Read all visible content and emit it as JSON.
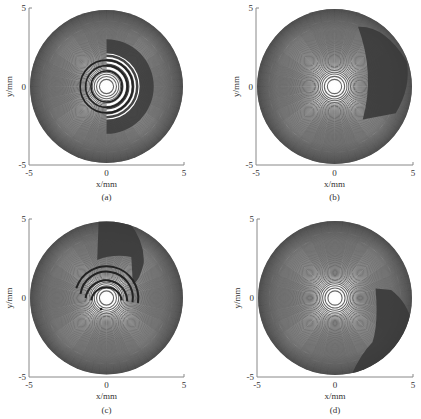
{
  "figure": {
    "panels": [
      {
        "id": "a",
        "caption": "(a)",
        "xlabel": "x/mm",
        "ylabel": "y/mm",
        "xticks": [
          "-5",
          "0",
          "5"
        ],
        "yticks": [
          "5",
          "0",
          "-5"
        ],
        "xlim": [
          -5,
          5
        ],
        "ylim": [
          -5,
          5
        ],
        "region": {
          "description": "dark half-annulus on right side (x>0), radius ~1 to ~3 mm",
          "x_from": 0,
          "r_inner": 1.0,
          "r_outer": 3.0
        }
      },
      {
        "id": "b",
        "caption": "(b)",
        "xlabel": "x/mm",
        "ylabel": "y/mm",
        "xticks": [
          "-5",
          "0",
          "5"
        ],
        "yticks": [
          "5",
          "0",
          "-5"
        ],
        "xlim": [
          -5,
          5
        ],
        "ylim": [
          -5,
          5
        ],
        "region": {
          "description": "dark crescent near right edge, x ~1.5 to 4.8 mm, y ~-2 to 3.8 mm"
        }
      },
      {
        "id": "c",
        "caption": "(c)",
        "xlabel": "x/mm",
        "ylabel": "y/mm",
        "xticks": [
          "-5",
          "0",
          "5"
        ],
        "yticks": [
          "5",
          "0",
          "-5"
        ],
        "xlim": [
          -5,
          5
        ],
        "ylim": [
          -5,
          5
        ],
        "region": {
          "description": "dark region at top, x ~-0.5 to 2.5 mm, y ~1 to 5 mm, with partial dark rings below"
        }
      },
      {
        "id": "d",
        "caption": "(d)",
        "xlabel": "x/mm",
        "ylabel": "y/mm",
        "xticks": [
          "-5",
          "0",
          "5"
        ],
        "yticks": [
          "5",
          "0",
          "-5"
        ],
        "xlim": [
          -5,
          5
        ],
        "ylim": [
          -5,
          5
        ],
        "region": {
          "description": "dark region lower-right, x ~1 to 5 mm, y ~-5 to 0.5 mm"
        }
      }
    ],
    "colors": {
      "ring": "#555555",
      "dark_region": "#3a3a3a",
      "axis": "#888888",
      "text": "#333333",
      "background": "#ffffff"
    }
  },
  "chart_data": [
    {
      "type": "contour",
      "title": "(a)",
      "xlabel": "x/mm",
      "ylabel": "y/mm",
      "xlim": [
        -5,
        5
      ],
      "ylim": [
        -5,
        5
      ],
      "xticks": [
        -5,
        0,
        5
      ],
      "yticks": [
        -5,
        0,
        5
      ],
      "grid": false,
      "pattern": "concentric circular fringes, increasing density toward edge radius 5",
      "highlight": "dark half-annulus x>0, r 1-3"
    },
    {
      "type": "contour",
      "title": "(b)",
      "xlabel": "x/mm",
      "ylabel": "y/mm",
      "xlim": [
        -5,
        5
      ],
      "ylim": [
        -5,
        5
      ],
      "xticks": [
        -5,
        0,
        5
      ],
      "yticks": [
        -5,
        0,
        5
      ],
      "grid": false,
      "pattern": "concentric circular fringes",
      "highlight": "dark crescent right side"
    },
    {
      "type": "contour",
      "title": "(c)",
      "xlabel": "x/mm",
      "ylabel": "y/mm",
      "xlim": [
        -5,
        5
      ],
      "ylim": [
        -5,
        5
      ],
      "xticks": [
        -5,
        0,
        5
      ],
      "yticks": [
        -5,
        0,
        5
      ],
      "grid": false,
      "pattern": "concentric circular fringes",
      "highlight": "dark region top, slightly right of center"
    },
    {
      "type": "contour",
      "title": "(d)",
      "xlabel": "x/mm",
      "ylabel": "y/mm",
      "xlim": [
        -5,
        5
      ],
      "ylim": [
        -5,
        5
      ],
      "xticks": [
        -5,
        0,
        5
      ],
      "yticks": [
        -5,
        0,
        5
      ],
      "grid": false,
      "pattern": "concentric circular fringes",
      "highlight": "dark region lower-right"
    }
  ]
}
